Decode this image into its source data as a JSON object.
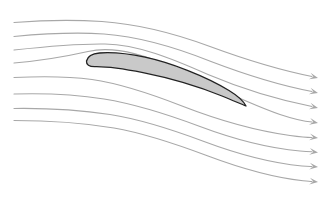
{
  "figure": {
    "alt_text": "Streamlines of air flowing from left to right over a cambered airfoil at a positive angle of attack; the flow is deflected downward behind the airfoil.",
    "background_color": "#ffffff",
    "width": 326,
    "height": 198,
    "caption_fragment": ""
  },
  "airfoil": {
    "name": "airfoil-cross-section",
    "fill_color": "#c9c9c9",
    "outline_color": "#222222",
    "outline_width": 1.3,
    "leading_edge": {
      "x": 86,
      "y": 62
    },
    "trailing_edge": {
      "x": 246,
      "y": 106
    },
    "chord_length_px": 166,
    "max_thickness_px": 22,
    "angle_of_attack_deg": 15,
    "path": "M 86.5 61.0 C 87.5 56.5 92.5 53.6 99.5 53.0 C 112.0 52.0 128.0 53.6 145.0 57.2 C 170.0 62.5 205.0 76.0 229.0 90.5 C 238.0 96.0 243.5 101.0 246.0 106.0 C 241.0 104.0 233.0 100.5 222.0 96.0 C 200.0 87.0 170.0 78.0 143.0 72.6 C 122.0 68.4 105.0 66.4 95.0 66.6 C 89.0 66.7 86.2 64.6 86.5 61.0 Z"
  },
  "streamlines": {
    "name": "streamline-set",
    "count": 8,
    "stroke_color": "#a8a8a8",
    "stroke_width": 1.15,
    "arrow_color": "#a8a8a8",
    "flow_direction": "left-to-right",
    "inlet_x": 14,
    "outlet_x": 318,
    "lines": [
      {
        "id": "streamline-1",
        "position": "upper-outer",
        "inlet_y": 22,
        "outlet_y": 78,
        "path": "M 14 22.5 C 45 20.0 72 19.5 102 21.5 C 140 24.2 175 33.5 210 46.5 C 248 60.5 282 70.5 312 76.5",
        "arrow": {
          "x": 318,
          "y": 78.0,
          "angle_deg": 14
        }
      },
      {
        "id": "streamline-2",
        "position": "upper",
        "inlet_y": 36,
        "outlet_y": 93,
        "path": "M 14 36.5 C 46 33.5 74 32.0 104 34.0 C 142 36.8 176 47.5 211 61.5 C 249 76.0 283 86.0 312 91.5",
        "arrow": {
          "x": 318,
          "y": 93.0,
          "angle_deg": 14
        }
      },
      {
        "id": "streamline-3",
        "position": "upper-inner",
        "inlet_y": 49,
        "outlet_y": 108,
        "path": "M 14 50.0 C 46 46.5 76 43.5 105 44.0 C 138 44.6 172 58.5 208 74.5 C 247 91.0 282 100.5 312 106.5",
        "arrow": {
          "x": 318,
          "y": 108.0,
          "angle_deg": 14
        }
      },
      {
        "id": "streamline-4",
        "position": "upper-surface",
        "inlet_y": 62,
        "outlet_y": 123,
        "path": "M 14 63.0 C 44 60.5 68 56.0 88 51.5 C 112 46.0 140 53.0 170 66.5 C 205 82.5 248 103.5 280 114.5 C 295 119.5 305 121.5 312 122.0",
        "arrow": {
          "x": 318,
          "y": 123.0,
          "angle_deg": 11
        }
      },
      {
        "id": "streamline-5",
        "position": "lower-surface",
        "inlet_y": 77,
        "outlet_y": 138,
        "path": "M 14 77.5 C 46 76.0 70 76.5 92 79.5 C 120 83.5 150 93.5 182 106.0 C 218 120.0 258 131.0 290 135.5 C 301 137.0 308 137.5 312 137.5",
        "arrow": {
          "x": 318,
          "y": 138.0,
          "angle_deg": 8
        }
      },
      {
        "id": "streamline-6",
        "position": "lower",
        "inlet_y": 94,
        "outlet_y": 152,
        "path": "M 14 94.0 C 48 93.0 76 94.5 104 99.0 C 136 104.2 168 114.5 200 126.5 C 236 140.0 272 148.5 300 151.0 C 306 151.5 310 151.7 312 151.8",
        "arrow": {
          "x": 318,
          "y": 152.5,
          "angle_deg": 7
        }
      },
      {
        "id": "streamline-7",
        "position": "lower-outer",
        "inlet_y": 108,
        "outlet_y": 167,
        "path": "M 14 108.5 C 50 108.0 80 110.0 110 114.5 C 142 119.5 172 129.5 204 141.5 C 240 155.0 276 163.5 302 166.0 C 307 166.4 310 166.5 312 166.6",
        "arrow": {
          "x": 318,
          "y": 167.0,
          "angle_deg": 6
        }
      },
      {
        "id": "streamline-8",
        "position": "bottom-outer",
        "inlet_y": 120,
        "outlet_y": 182,
        "path": "M 14 120.5 C 52 120.5 84 123.0 114 128.0 C 146 133.5 176 144.0 208 156.0 C 244 169.5 278 178.0 303 180.8 C 308 181.3 310 181.5 312 181.6",
        "arrow": {
          "x": 318,
          "y": 182.0,
          "angle_deg": 6
        }
      }
    ]
  }
}
